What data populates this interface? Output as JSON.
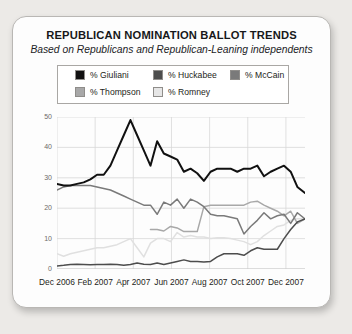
{
  "card": {
    "title": "REPUBLICAN NOMINATION BALLOT TRENDS",
    "subtitle": "Based on Republicans and Republican-Leaning independents"
  },
  "legend": {
    "position": "top-inside",
    "items": [
      {
        "label": "% Giuliani",
        "color": "#111111"
      },
      {
        "label": "% Huckabee",
        "color": "#4d4d4d"
      },
      {
        "label": "% McCain",
        "color": "#7a7a7a"
      },
      {
        "label": "% Thompson",
        "color": "#a8a8a8"
      },
      {
        "label": "% Romney",
        "color": "#e0e0e0"
      }
    ]
  },
  "chart_data": {
    "type": "line",
    "title": "REPUBLICAN NOMINATION BALLOT TRENDS",
    "subtitle": "Based on Republicans and Republican-Leaning independents",
    "xlabel": "",
    "ylabel": "",
    "ylim": [
      0,
      50
    ],
    "yticks": [
      0,
      10,
      20,
      30,
      40,
      50
    ],
    "xlim": [
      0,
      13
    ],
    "xticks": [
      0,
      2,
      4,
      6,
      8,
      10,
      12
    ],
    "xticklabels": [
      "Dec 2006",
      "Feb 2007",
      "Apr 2007",
      "Jun 2007",
      "Aug 2007",
      "Oct 2007",
      "Dec 2007"
    ],
    "grid": true,
    "x": [
      0,
      0.35,
      0.7,
      1.05,
      1.4,
      1.75,
      2.1,
      2.45,
      2.8,
      3.15,
      3.5,
      3.85,
      4.2,
      4.55,
      4.9,
      5.25,
      5.6,
      5.95,
      6.3,
      6.65,
      7.0,
      7.35,
      7.7,
      8.05,
      8.4,
      8.75,
      9.1,
      9.45,
      9.8,
      10.15,
      10.5,
      10.85,
      11.2,
      11.55,
      11.9,
      12.25,
      12.6,
      13.0
    ],
    "series": [
      {
        "name": "% Giuliani",
        "color": "#111111",
        "values": [
          28,
          27.5,
          27.5,
          28,
          28.5,
          29.5,
          31,
          31,
          34,
          39,
          44,
          49,
          44,
          39,
          34,
          42,
          38,
          37,
          36,
          32,
          33,
          31.5,
          29,
          32,
          33,
          33,
          33,
          32,
          33,
          33,
          34,
          30.5,
          32,
          33,
          34,
          32,
          27,
          25
        ]
      },
      {
        "name": "% Huckabee",
        "color": "#4d4d4d",
        "values": [
          1,
          1.2,
          1.5,
          1.6,
          1.5,
          1.4,
          1.5,
          1.5,
          1.6,
          1.5,
          1.2,
          1.5,
          2,
          1.6,
          1.5,
          2,
          1.5,
          2,
          2.5,
          3,
          2.5,
          2.5,
          2.3,
          2.5,
          4,
          5,
          5,
          5,
          4.5,
          6,
          7,
          6.5,
          6.5,
          6.5,
          10,
          13,
          15.5,
          16.5
        ]
      },
      {
        "name": "% McCain",
        "color": "#7a7a7a",
        "values": [
          26,
          27,
          27.5,
          27.5,
          27.5,
          27.5,
          27,
          26.5,
          26,
          25,
          24,
          23,
          22,
          21,
          21,
          18,
          22,
          21,
          23,
          20,
          23,
          22,
          20.5,
          18,
          17.5,
          17.5,
          17,
          16.5,
          11.5,
          14,
          16,
          18.5,
          16.5,
          17.5,
          18,
          15,
          18.5,
          16.5
        ]
      },
      {
        "name": "% Thompson",
        "color": "#a8a8a8",
        "values": [
          null,
          null,
          null,
          null,
          null,
          null,
          null,
          null,
          null,
          null,
          null,
          null,
          null,
          null,
          13,
          13,
          12.5,
          14,
          13.5,
          12.3,
          12.3,
          12.3,
          20.5,
          21,
          21,
          21,
          21,
          21,
          21,
          22,
          22.3,
          21,
          20,
          19,
          17.5,
          19,
          15,
          16.5
        ]
      },
      {
        "name": "% Romney",
        "color": "#e0e0e0",
        "values": [
          5,
          4.2,
          5,
          5.5,
          6,
          6.5,
          7,
          7,
          7.5,
          8,
          9,
          10,
          7,
          4,
          8.5,
          10,
          10,
          9,
          12,
          10.5,
          11,
          10.5,
          10.5,
          10,
          10.3,
          10.3,
          10,
          9.5,
          9,
          8,
          9,
          11,
          12.5,
          14,
          14.5,
          16,
          16.5,
          16.5
        ]
      }
    ]
  }
}
